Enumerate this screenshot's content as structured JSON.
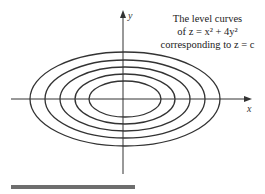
{
  "figure": {
    "caption_lines": [
      "The level curves",
      "of z = x² + 4y²",
      "corresponding to z = c"
    ],
    "x_axis_label": "x",
    "y_axis_label": "y",
    "equation": "z = x^2 + 4y^2",
    "curve_count": 5
  },
  "colors": {
    "stroke": "#333333",
    "bar": "#6e6e6e"
  }
}
